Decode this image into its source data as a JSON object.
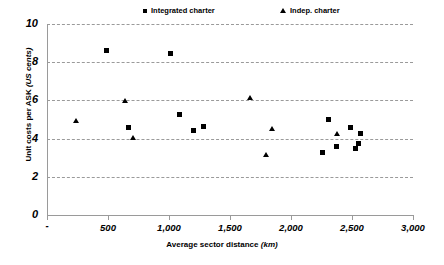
{
  "chart_data": {
    "type": "scatter",
    "title": "",
    "xlabel": "Average sector distance",
    "xlabel_unit": "(km)",
    "ylabel": "Unit costs per ASK",
    "ylabel_unit": "(US cents)",
    "xlim": [
      0,
      3000
    ],
    "ylim": [
      0,
      10
    ],
    "xticks": [
      0,
      500,
      1000,
      1500,
      2000,
      2500,
      3000
    ],
    "xtick_labels": [
      "-",
      "500",
      "1,000",
      "1,500",
      "2,000",
      "2,500",
      "3,000"
    ],
    "yticks": [
      0,
      2,
      4,
      6,
      8,
      10
    ],
    "ytick_labels": [
      "0",
      "2",
      "4",
      "6",
      "8",
      "10"
    ],
    "grid": "horizontal-dashed",
    "legend_position": "top",
    "series": [
      {
        "name": "Integrated charter",
        "marker": "square",
        "color": "#000000",
        "points": [
          {
            "x": 490,
            "y": 8.6
          },
          {
            "x": 1010,
            "y": 8.45
          },
          {
            "x": 670,
            "y": 4.6
          },
          {
            "x": 1090,
            "y": 5.25
          },
          {
            "x": 1200,
            "y": 4.4
          },
          {
            "x": 1285,
            "y": 4.65
          },
          {
            "x": 2255,
            "y": 3.25
          },
          {
            "x": 2310,
            "y": 5.0
          },
          {
            "x": 2370,
            "y": 3.6
          },
          {
            "x": 2490,
            "y": 4.6
          },
          {
            "x": 2525,
            "y": 3.5
          },
          {
            "x": 2555,
            "y": 3.75
          },
          {
            "x": 2570,
            "y": 4.25
          }
        ]
      },
      {
        "name": "Indep. charter",
        "marker": "triangle",
        "color": "#000000",
        "points": [
          {
            "x": 240,
            "y": 4.9
          },
          {
            "x": 640,
            "y": 5.95
          },
          {
            "x": 710,
            "y": 4.05
          },
          {
            "x": 1665,
            "y": 6.15
          },
          {
            "x": 1800,
            "y": 3.15
          },
          {
            "x": 1845,
            "y": 4.5
          },
          {
            "x": 2375,
            "y": 4.25
          }
        ]
      }
    ]
  }
}
